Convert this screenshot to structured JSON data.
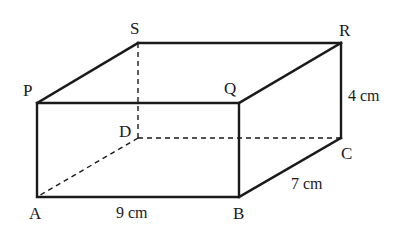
{
  "diagram": {
    "type": "cuboid",
    "vertices": {
      "P": {
        "label": "P",
        "x": 37,
        "y": 103
      },
      "Q": {
        "label": "Q",
        "x": 239,
        "y": 103
      },
      "R": {
        "label": "R",
        "x": 341,
        "y": 43
      },
      "S": {
        "label": "S",
        "x": 138,
        "y": 43
      },
      "A": {
        "label": "A",
        "x": 37,
        "y": 197
      },
      "B": {
        "label": "B",
        "x": 239,
        "y": 197
      },
      "C": {
        "label": "C",
        "x": 341,
        "y": 138
      },
      "D": {
        "label": "D",
        "x": 138,
        "y": 138
      }
    },
    "dimensions": {
      "length": "9 cm",
      "width": "7 cm",
      "height": "4 cm"
    },
    "edge_color": "#1a1a1a",
    "background": "#ffffff"
  }
}
